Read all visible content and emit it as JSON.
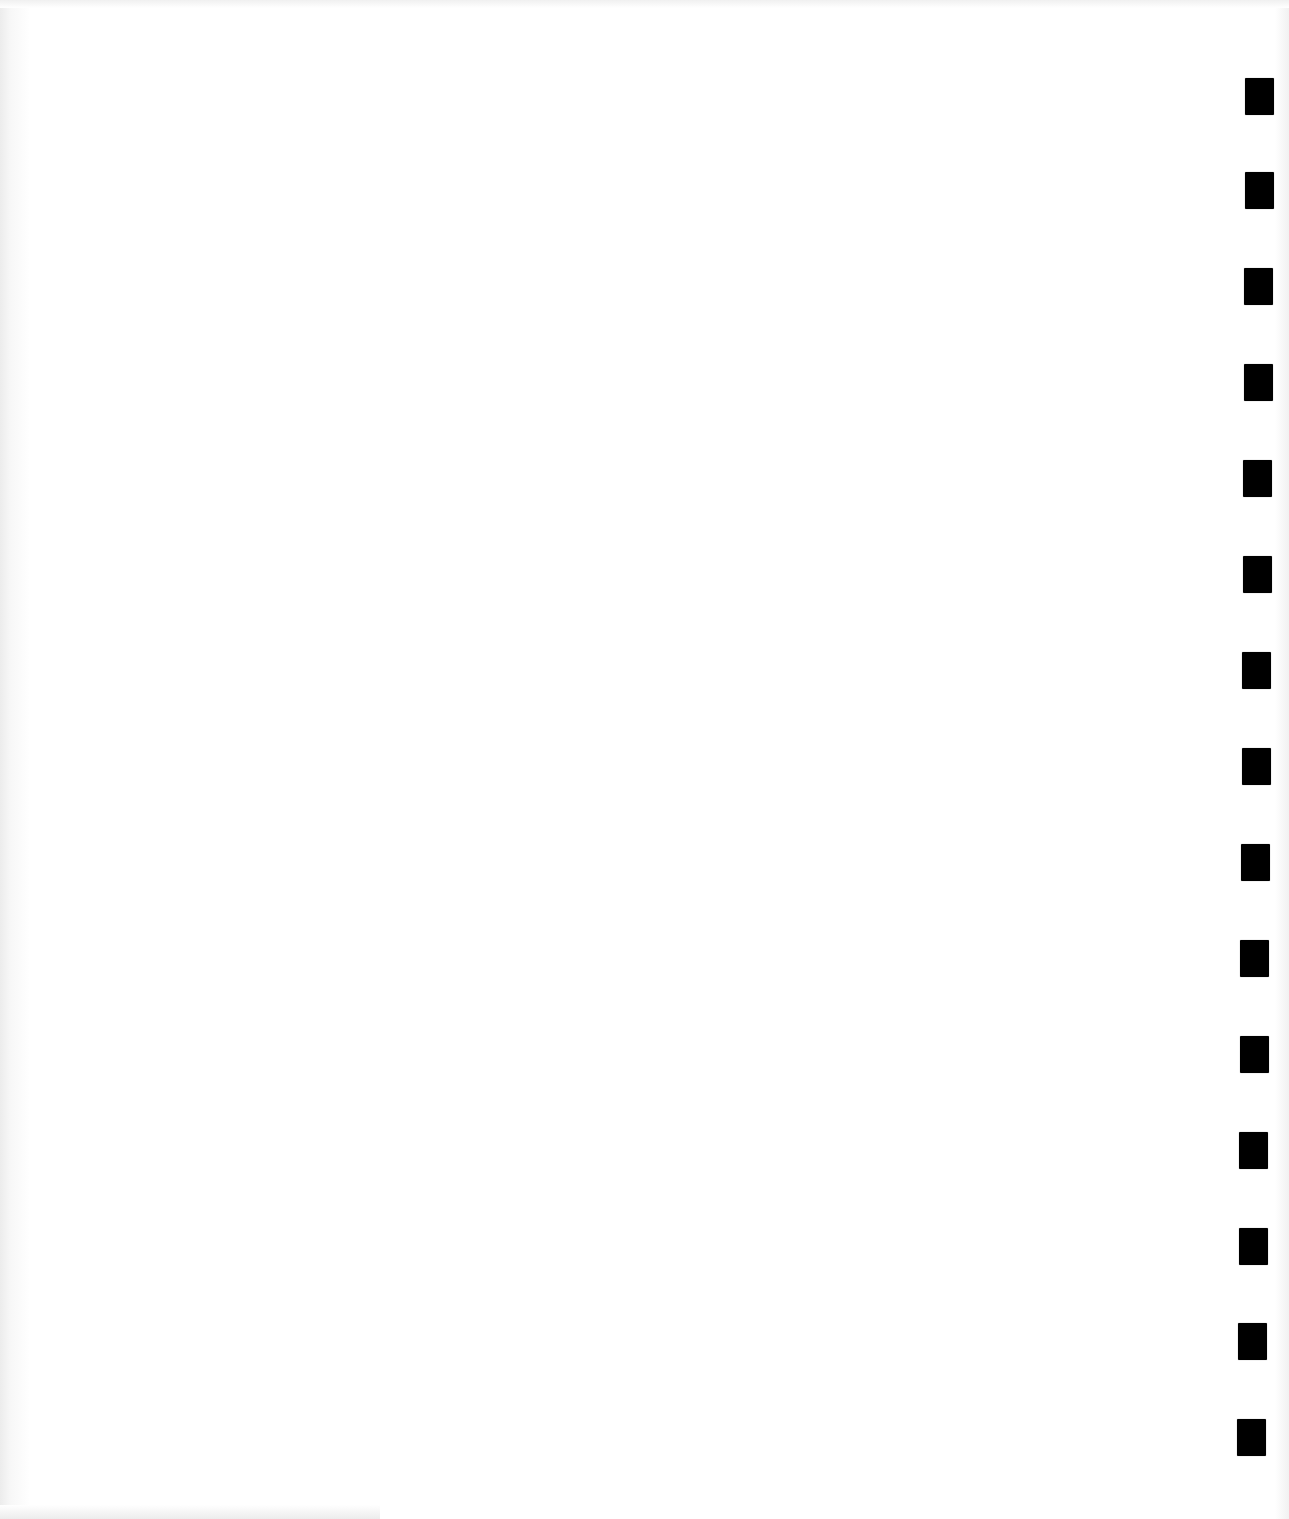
{
  "page": {
    "type": "blank scanned form page",
    "background_color": "#ffffff",
    "text": ""
  },
  "timing_marks": {
    "color": "#000000",
    "count": 15,
    "items": [
      {
        "x": 1245,
        "y": 78
      },
      {
        "x": 1245,
        "y": 172
      },
      {
        "x": 1244,
        "y": 268
      },
      {
        "x": 1244,
        "y": 364
      },
      {
        "x": 1243,
        "y": 460
      },
      {
        "x": 1243,
        "y": 556
      },
      {
        "x": 1242,
        "y": 652
      },
      {
        "x": 1242,
        "y": 748
      },
      {
        "x": 1241,
        "y": 844
      },
      {
        "x": 1240,
        "y": 940
      },
      {
        "x": 1240,
        "y": 1036
      },
      {
        "x": 1239,
        "y": 1132
      },
      {
        "x": 1239,
        "y": 1228
      },
      {
        "x": 1238,
        "y": 1323
      },
      {
        "x": 1237,
        "y": 1419
      }
    ]
  }
}
